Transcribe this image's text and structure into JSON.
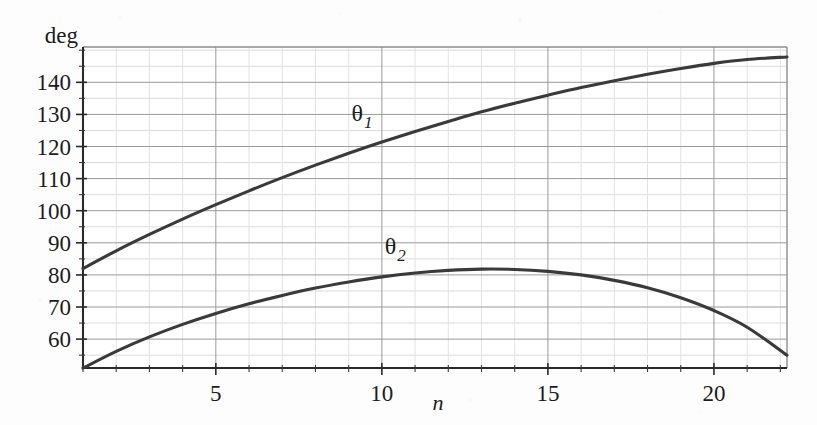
{
  "chart_data": {
    "type": "line",
    "title": "",
    "subtitle": "",
    "xlabel": "n",
    "ylabel": "deg",
    "xlim": [
      1,
      22.2
    ],
    "ylim": [
      51,
      151
    ],
    "grid": true,
    "legend": "inline-curve-labels",
    "x_ticks": [
      5,
      10,
      15,
      20
    ],
    "x_tick_labels": [
      "5",
      "10",
      "15",
      "20"
    ],
    "x_minor_tick_step": 1,
    "y_ticks": [
      60,
      70,
      80,
      90,
      100,
      110,
      120,
      130,
      140
    ],
    "y_tick_labels": [
      "60",
      "70",
      "80",
      "90",
      "100",
      "110",
      "120",
      "130",
      "140"
    ],
    "y_minor_tick_step": 5,
    "series": [
      {
        "name": "theta_1",
        "label_base": "θ",
        "label_sub": "1",
        "label_x": 9.4,
        "label_y": 128,
        "x": [
          1,
          2,
          3,
          4,
          5,
          6,
          7,
          8,
          9,
          10,
          11,
          12,
          13,
          14,
          15,
          16,
          17,
          18,
          19,
          20,
          21,
          22.2
        ],
        "values": [
          82.0,
          87.5,
          92.6,
          97.4,
          101.9,
          106.2,
          110.3,
          114.2,
          117.9,
          121.4,
          124.7,
          127.8,
          130.8,
          133.5,
          136.0,
          138.4,
          140.5,
          142.5,
          144.3,
          145.9,
          147.1,
          147.9
        ]
      },
      {
        "name": "theta_2",
        "label_base": "θ",
        "label_sub": "2",
        "label_x": 10.4,
        "label_y": 86.5,
        "x": [
          1,
          2,
          3,
          4,
          5,
          6,
          7,
          8,
          9,
          10,
          11,
          12,
          13,
          14,
          15,
          16,
          17,
          18,
          19,
          20,
          21,
          22.2
        ],
        "values": [
          51.0,
          56.2,
          60.7,
          64.6,
          68.0,
          71.0,
          73.6,
          75.9,
          77.8,
          79.4,
          80.6,
          81.4,
          81.8,
          81.7,
          81.1,
          80.0,
          78.3,
          76.0,
          72.9,
          68.9,
          63.7,
          55.0
        ]
      }
    ]
  },
  "axes": {
    "y_axis_caption": "deg",
    "x_axis_caption": "n"
  }
}
